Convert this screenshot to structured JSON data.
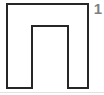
{
  "figure": {
    "label": "1",
    "label_color": "#7f7f7f",
    "background_color": "#ffffff",
    "stroke_color": "#262626",
    "stroke_width": 2,
    "fill_color": "#ffffff",
    "shape_name": "inverted-u-polygon",
    "shape_description": "Square outline with a rectangular notch cut upward from the bottom edge, forming an inverted U (pi) shape",
    "canvas": {
      "width": 104,
      "height": 95
    },
    "outer_bounds": {
      "left": 7,
      "top": 4,
      "right": 88,
      "bottom": 88
    },
    "notch_bounds": {
      "left": 32,
      "top": 26,
      "right": 68,
      "bottom": 88
    },
    "vertices": [
      [
        7,
        4
      ],
      [
        88,
        4
      ],
      [
        88,
        88
      ],
      [
        68,
        88
      ],
      [
        68,
        26
      ],
      [
        32,
        26
      ],
      [
        32,
        88
      ],
      [
        7,
        88
      ]
    ],
    "rule_color": "#e2e2e2",
    "rule_y": 92
  }
}
